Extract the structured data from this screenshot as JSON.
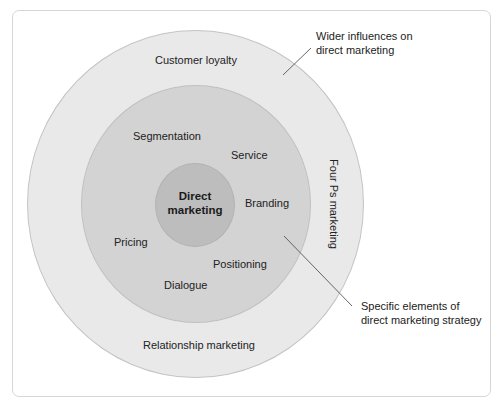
{
  "diagram": {
    "type": "concentric-circles",
    "center_label": "Direct marketing",
    "center_label_lines": [
      "Direct",
      "marketing"
    ],
    "middle_ring": {
      "description": "Specific elements of direct marketing strategy",
      "items": [
        "Segmentation",
        "Service",
        "Branding",
        "Pricing",
        "Positioning",
        "Dialogue"
      ]
    },
    "outer_ring": {
      "description": "Wider influences on direct marketing",
      "items": [
        "Customer loyalty",
        "Four Ps marketing",
        "Relationship marketing"
      ]
    },
    "callouts": {
      "outer": {
        "line1": "Wider influences on",
        "line2": "direct marketing"
      },
      "middle": {
        "line1": "Specific elements of",
        "line2": "direct marketing strategy"
      }
    },
    "colors": {
      "outer_fill": "#e9e9e9",
      "middle_fill": "#d3d3d3",
      "inner_fill": "#bdbdbd",
      "frame_border": "#d6d6d6",
      "leader_line": "#555555"
    }
  },
  "caption": "Figure (truncated)"
}
